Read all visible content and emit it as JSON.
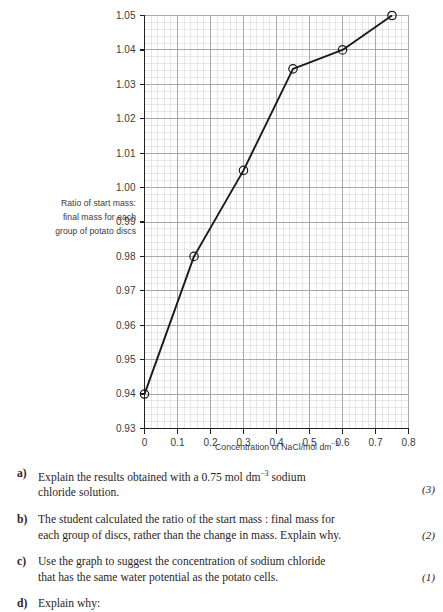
{
  "chart_data": {
    "type": "line",
    "title": "",
    "xlabel": "Concentration of NaCl/mol dm⁻³",
    "ylabel": "Ratio of start mass : final mass for each group of potato discs",
    "ylabel_lines": [
      "Ratio of start mass:",
      "final mass for each",
      "group of potato discs"
    ],
    "x": [
      0,
      0.15,
      0.3,
      0.45,
      0.6,
      0.75
    ],
    "values": [
      0.94,
      0.98,
      1.005,
      1.0345,
      1.04,
      1.05
    ],
    "xlim": [
      0,
      0.8
    ],
    "ylim": [
      0.93,
      1.05
    ],
    "xticks": [
      "0",
      "0.1",
      "0.2",
      "0.3",
      "0.4",
      "0.5",
      "0.6",
      "0.7",
      "0.8"
    ],
    "xtick_values": [
      0,
      0.1,
      0.2,
      0.3,
      0.4,
      0.5,
      0.6,
      0.7,
      0.8
    ],
    "yticks": [
      "0.93",
      "0.94",
      "0.95",
      "0.96",
      "0.97",
      "0.98",
      "0.99",
      "1.00",
      "1.01",
      "1.02",
      "1.03",
      "1.04",
      "1.05"
    ],
    "ytick_values": [
      0.93,
      0.94,
      0.95,
      0.96,
      0.97,
      0.98,
      0.99,
      1.0,
      1.01,
      1.02,
      1.03,
      1.04,
      1.05
    ],
    "grid": true,
    "grid_minor": true,
    "legend": "none",
    "marker": "open-circle",
    "line_color": "#1a1a1a",
    "grid_major_color": "#9a9a9a",
    "grid_minor_color": "#cfcfcf"
  },
  "figure": {
    "ylabel_lines": [
      "Ratio of start mass:",
      "final mass for each",
      "group of potato discs"
    ],
    "xlabel_main": "Concentration of NaCl/mol dm",
    "xlabel_exponent": "−3"
  },
  "questions": [
    {
      "marker": "a)",
      "text_line1": "Explain the results obtained with a 0.75 mol dm",
      "text_exp": "−3",
      "text_line1b": " sodium",
      "text_line2": "chloride solution.",
      "marks": "(3)"
    },
    {
      "marker": "b)",
      "text_line1": "The student calculated the ratio of the start mass : final mass for",
      "text_line2": "each group of discs, rather than the change in mass. Explain why.",
      "marks": "(2)"
    },
    {
      "marker": "c)",
      "text_line1": "Use the graph to suggest the concentration of sodium chloride",
      "text_line2": "that has the same water potential as the potato cells.",
      "marks": "(1)"
    },
    {
      "marker": "d)",
      "text_line1": "Explain why:",
      "text_line2": "",
      "marks": ""
    }
  ]
}
